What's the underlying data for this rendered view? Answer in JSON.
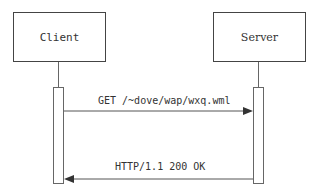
{
  "participants": [
    {
      "id": "client",
      "label": "Client"
    },
    {
      "id": "server",
      "label": "Server"
    }
  ],
  "messages": [
    {
      "from": "client",
      "to": "server",
      "label": "GET /~dove/wap/wxq.wml"
    },
    {
      "from": "server",
      "to": "client",
      "label": "HTTP/1.1 200 OK"
    }
  ],
  "colors": {
    "line": "#444444",
    "text": "#333333"
  }
}
